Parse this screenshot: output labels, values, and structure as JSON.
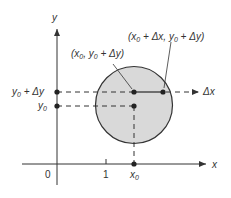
{
  "diagram": {
    "axes": {
      "x_label": "x",
      "y_label": "y",
      "origin_label": "0",
      "tick_1_label": "1"
    },
    "labels": {
      "x0": "x",
      "x0_sub": "0",
      "y0": "y",
      "y0_sub": "0",
      "y0_plus_dy_prefix": "y",
      "y0_plus_dy_sub": "0",
      "y0_plus_dy_suffix": " + Δy",
      "delta_x": "Δx",
      "point_top_left": "(x",
      "point_top_left_sub1": "0",
      "point_top_left_mid": ", y",
      "point_top_left_sub2": "0",
      "point_top_left_end": " + Δy)",
      "point_top_right": "(x",
      "point_top_right_sub1": "0",
      "point_top_right_mid": " + Δx, y",
      "point_top_right_sub2": "0",
      "point_top_right_end": " + Δy)"
    },
    "colors": {
      "circle_fill": "#d9d9d9",
      "stroke": "#333333",
      "background": "#ffffff"
    }
  }
}
